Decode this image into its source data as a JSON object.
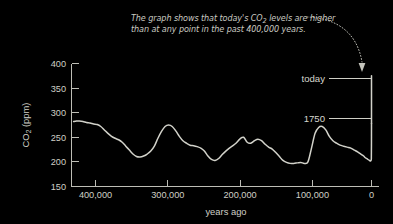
{
  "figure": {
    "background_color": "#000000",
    "foreground_color": "#cfcfc6",
    "line_color": "#d2d2ca"
  },
  "caption": {
    "line1_a": "The graph shows that today's CO",
    "line1_sub": "2",
    "line1_b": " levels are higher",
    "line2": "than at any point in the past 400,000 years.",
    "pointer_icon": "dotted-curved-arrow"
  },
  "annotations": [
    {
      "label": "today",
      "ppm": 375
    },
    {
      "label": "1750",
      "ppm": 280
    }
  ],
  "axes": {
    "y_title_a": "CO",
    "y_title_sub": "2",
    "y_title_b": " (ppm)",
    "y_ticks": [
      "400",
      "350",
      "300",
      "250",
      "200",
      "150"
    ],
    "y_values": [
      400,
      350,
      300,
      250,
      200,
      150
    ],
    "x_title": "years ago",
    "x_ticks": [
      "400,000",
      "300,000",
      "200,000",
      "100,000",
      "0"
    ],
    "x_values": [
      400000,
      300000,
      200000,
      100000,
      0
    ]
  },
  "chart_data": {
    "type": "line",
    "title": "",
    "subtitle": "The graph shows that today's CO2 levels are higher than at any point in the past 400,000 years.",
    "xlabel": "years ago",
    "ylabel": "CO2 (ppm)",
    "xlim": [
      420000,
      0
    ],
    "ylim": [
      150,
      400
    ],
    "x_reversed": true,
    "grid": false,
    "legend": "none",
    "yticks": [
      150,
      200,
      250,
      300,
      350,
      400
    ],
    "xticks": [
      400000,
      300000,
      200000,
      100000,
      0
    ],
    "annotations": [
      {
        "text": "today",
        "x": 0,
        "y": 375
      },
      {
        "text": "1750",
        "x": 0,
        "y": 280
      }
    ],
    "series": [
      {
        "name": "CO2 (ice core + modern)",
        "x": [
          417000,
          413000,
          409000,
          404000,
          399000,
          394000,
          389000,
          384000,
          379000,
          374000,
          369000,
          364000,
          359000,
          354000,
          349000,
          344000,
          339000,
          334000,
          329000,
          324000,
          319000,
          314000,
          309000,
          304000,
          299000,
          294000,
          289000,
          284000,
          279000,
          274000,
          269000,
          264000,
          259000,
          254000,
          249000,
          244000,
          239000,
          234000,
          229000,
          224000,
          219000,
          214000,
          209000,
          204000,
          199000,
          194000,
          189000,
          184000,
          179000,
          174000,
          169000,
          164000,
          159000,
          154000,
          149000,
          144000,
          139000,
          134000,
          129000,
          124000,
          119000,
          114000,
          109000,
          104000,
          99000,
          94000,
          89000,
          84000,
          79000,
          74000,
          69000,
          64000,
          59000,
          54000,
          49000,
          44000,
          39000,
          34000,
          29000,
          24000,
          19000,
          14000,
          11000,
          9000,
          6000,
          3000,
          1000,
          260,
          200,
          120,
          60,
          30,
          10,
          0
        ],
        "y": [
          282,
          283,
          283,
          282,
          280,
          279,
          277,
          276,
          272,
          265,
          258,
          252,
          248,
          245,
          240,
          232,
          224,
          216,
          211,
          210,
          212,
          216,
          222,
          232,
          248,
          262,
          272,
          275,
          272,
          263,
          252,
          243,
          238,
          234,
          233,
          231,
          228,
          222,
          212,
          205,
          203,
          207,
          215,
          222,
          228,
          233,
          239,
          247,
          250,
          240,
          238,
          243,
          246,
          243,
          236,
          230,
          226,
          219,
          211,
          203,
          199,
          197,
          197,
          198,
          199,
          197,
          200,
          228,
          258,
          270,
          272,
          265,
          252,
          243,
          238,
          234,
          232,
          230,
          228,
          224,
          220,
          215,
          212,
          209,
          206,
          203,
          202,
          205,
          212,
          222,
          238,
          252,
          268,
          278
        ]
      },
      {
        "name": "modern rise",
        "x": [
          0,
          0,
          0,
          0
        ],
        "y": [
          278,
          300,
          340,
          375
        ]
      }
    ]
  }
}
